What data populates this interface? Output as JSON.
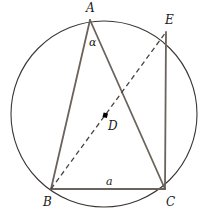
{
  "figure": {
    "type": "geometry-diagram",
    "width": 210,
    "height": 214,
    "background_color": "#ffffff"
  },
  "colors": {
    "circle_stroke": "#3c3632",
    "solid_segment": "#6b635c",
    "dashed_segment": "#4a443f",
    "label_text": "#1a1a1a",
    "center_dot": "#000000"
  },
  "circle": {
    "label": "circumscribed-circle",
    "cx": 104,
    "cy": 114,
    "r": 93,
    "stroke_width": 1.1
  },
  "points": [
    {
      "id": "A",
      "label": "A",
      "x": 90,
      "y": 20,
      "label_x": 86,
      "label_y": 2,
      "kind": "vertex"
    },
    {
      "id": "B",
      "label": "B",
      "x": 51,
      "y": 189,
      "label_x": 43,
      "label_y": 196,
      "kind": "vertex"
    },
    {
      "id": "C",
      "label": "C",
      "x": 165,
      "y": 189,
      "label_x": 166,
      "label_y": 196,
      "kind": "vertex"
    },
    {
      "id": "D",
      "label": "D",
      "x": 105,
      "y": 115,
      "label_x": 108,
      "label_y": 120,
      "kind": "center"
    },
    {
      "id": "E",
      "label": "E",
      "x": 166,
      "y": 32,
      "label_x": 165,
      "label_y": 14,
      "kind": "vertex"
    }
  ],
  "segments": [
    {
      "id": "AB",
      "from": "A",
      "to": "B",
      "style": "solid",
      "stroke_width": 1.8
    },
    {
      "id": "AC",
      "from": "A",
      "to": "C",
      "style": "solid",
      "stroke_width": 1.8
    },
    {
      "id": "BC",
      "from": "B",
      "to": "C",
      "style": "solid",
      "stroke_width": 1.8
    },
    {
      "id": "EC",
      "from": "E",
      "to": "C",
      "style": "solid",
      "stroke_width": 1.8
    },
    {
      "id": "BE",
      "from": "B",
      "to": "E",
      "style": "dashed",
      "stroke_width": 1.3
    }
  ],
  "annotations": {
    "angle_at_a": {
      "symbol": "α",
      "x": 89,
      "y": 37,
      "description": "inscribed angle at vertex A subtending BC"
    },
    "side_bc": {
      "symbol": "a",
      "x": 106,
      "y": 176,
      "description": "length of side BC"
    }
  },
  "center_dot": {
    "x": 105,
    "y": 115,
    "size": 4
  }
}
